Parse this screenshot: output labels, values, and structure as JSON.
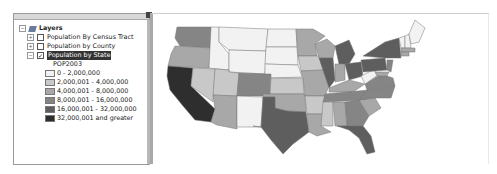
{
  "toc": {
    "root_label": "Layers",
    "layers": [
      {
        "label": "Population By Census Tract",
        "checked": false,
        "expanded": false
      },
      {
        "label": "Population by County",
        "checked": false,
        "expanded": false
      },
      {
        "label": "Population by State",
        "checked": true,
        "expanded": true,
        "selected": true
      }
    ],
    "legend_field": "POP2003",
    "legend": [
      {
        "label": "0 - 2,000,000",
        "color": "#f2f2f2"
      },
      {
        "label": "2,000,001 - 4,000,000",
        "color": "#c8c8c8"
      },
      {
        "label": "4,000,001 - 8,000,000",
        "color": "#a8a8a8"
      },
      {
        "label": "8,000,001 - 16,000,000",
        "color": "#858585"
      },
      {
        "label": "16,000,001 - 32,000,000",
        "color": "#5e5e5e"
      },
      {
        "label": "32,000,001 and greater",
        "color": "#2e2e2e"
      }
    ],
    "expand_symbol": "+",
    "collapse_symbol": "−",
    "check_symbol": "✓"
  },
  "map": {
    "title": "Population by State choropleth map"
  }
}
